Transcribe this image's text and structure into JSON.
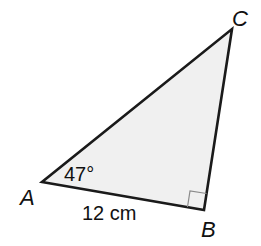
{
  "diagram": {
    "type": "right-triangle",
    "vertices": {
      "A": {
        "label": "A",
        "x": 42,
        "y": 182
      },
      "B": {
        "label": "B",
        "x": 204,
        "y": 210
      },
      "C": {
        "label": "C",
        "x": 232,
        "y": 29
      }
    },
    "angle_A_label": "47°",
    "side_AB_label": "12 cm",
    "right_angle_at": "B",
    "colors": {
      "fill": "#f0f0f0",
      "stroke": "#1a1a1a",
      "text": "#111111"
    }
  }
}
